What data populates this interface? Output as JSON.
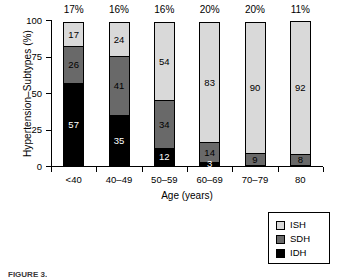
{
  "chart_data": {
    "type": "bar",
    "subtype": "stacked-bar-100-percent",
    "title": "",
    "xlabel": "Age (years)",
    "ylabel": "Hypertension–Subtypes (%)",
    "ylim": [
      0,
      100
    ],
    "yticks": [
      "0",
      "25",
      "50",
      "75",
      "100"
    ],
    "ytick_values": [
      0,
      25,
      50,
      75,
      100
    ],
    "grid": false,
    "legend_position": "bottom-right",
    "categories": [
      "<40",
      "40–49",
      "50–59",
      "60–69",
      "70–79",
      "80"
    ],
    "series": [
      {
        "name": "ISH",
        "color": "#d9d9d9",
        "values": [
          17,
          24,
          54,
          83,
          90,
          92
        ]
      },
      {
        "name": "SDH",
        "color": "#696969",
        "values": [
          26,
          41,
          34,
          14,
          9,
          8
        ]
      },
      {
        "name": "IDH",
        "color": "#000000",
        "values": [
          57,
          35,
          12,
          3,
          0,
          0
        ]
      }
    ],
    "bar_top_annotations": [
      "17%",
      "16%",
      "16%",
      "20%",
      "20%",
      "11%"
    ],
    "stack_order_top_to_bottom": [
      "ISH",
      "SDH",
      "IDH"
    ]
  },
  "axes": {
    "y_title": "Hypertension–Subtypes (%)",
    "x_title": "Age (years)",
    "y_tick_labels": [
      "100",
      "75",
      "50",
      "25",
      "0"
    ],
    "x_tick_labels": [
      "<40",
      "40–49",
      "50–59",
      "60–69",
      "70–79",
      "80"
    ]
  },
  "bars": [
    {
      "category": "<40",
      "top_annotation": "17%",
      "segments": [
        {
          "series": "ISH",
          "value": 17,
          "label": "17",
          "label_color": "dark"
        },
        {
          "series": "SDH",
          "value": 26,
          "label": "26",
          "label_color": "dark"
        },
        {
          "series": "IDH",
          "value": 57,
          "label": "57",
          "label_color": "light"
        }
      ]
    },
    {
      "category": "40–49",
      "top_annotation": "16%",
      "segments": [
        {
          "series": "ISH",
          "value": 24,
          "label": "24",
          "label_color": "dark"
        },
        {
          "series": "SDH",
          "value": 41,
          "label": "41",
          "label_color": "dark"
        },
        {
          "series": "IDH",
          "value": 35,
          "label": "35",
          "label_color": "light"
        }
      ]
    },
    {
      "category": "50–59",
      "top_annotation": "16%",
      "segments": [
        {
          "series": "ISH",
          "value": 54,
          "label": "54",
          "label_color": "dark"
        },
        {
          "series": "SDH",
          "value": 34,
          "label": "34",
          "label_color": "dark"
        },
        {
          "series": "IDH",
          "value": 12,
          "label": "12",
          "label_color": "light"
        }
      ]
    },
    {
      "category": "60–69",
      "top_annotation": "20%",
      "segments": [
        {
          "series": "ISH",
          "value": 83,
          "label": "83",
          "label_color": "dark"
        },
        {
          "series": "SDH",
          "value": 14,
          "label": "14",
          "label_color": "dark"
        },
        {
          "series": "IDH",
          "value": 3,
          "label": "3",
          "label_color": "light"
        }
      ]
    },
    {
      "category": "70–79",
      "top_annotation": "20%",
      "segments": [
        {
          "series": "ISH",
          "value": 90,
          "label": "90",
          "label_color": "dark"
        },
        {
          "series": "SDH",
          "value": 9,
          "label": "9",
          "label_color": "dark"
        },
        {
          "series": "IDH",
          "value": 0,
          "label": "",
          "label_color": "light"
        }
      ]
    },
    {
      "category": "80",
      "top_annotation": "11%",
      "segments": [
        {
          "series": "ISH",
          "value": 92,
          "label": "92",
          "label_color": "dark"
        },
        {
          "series": "SDH",
          "value": 8,
          "label": "8",
          "label_color": "dark"
        },
        {
          "series": "IDH",
          "value": 0,
          "label": "",
          "label_color": "light"
        }
      ]
    }
  ],
  "legend": {
    "items": [
      {
        "label": "ISH",
        "color": "#d9d9d9"
      },
      {
        "label": "SDH",
        "color": "#696969"
      },
      {
        "label": "IDH",
        "color": "#000000"
      }
    ]
  },
  "caption": {
    "text": "FIGURE 3."
  }
}
